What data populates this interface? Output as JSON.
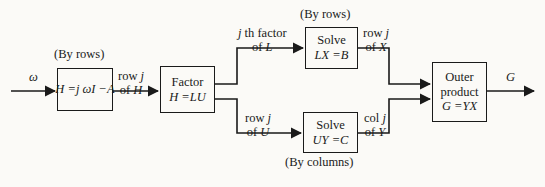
{
  "figure": {
    "type": "signal-flow-block-diagram",
    "input_symbol": "ω",
    "output_symbol": "G"
  },
  "blocks": [
    {
      "id": "form-matrix",
      "lines": [
        "H =j ωI −A"
      ],
      "caption": "(By rows)"
    },
    {
      "id": "factor",
      "lines": [
        "Factor",
        "H =LU"
      ],
      "caption": ""
    },
    {
      "id": "solve-lx",
      "lines": [
        "Solve",
        "LX =B"
      ],
      "caption": "(By rows)"
    },
    {
      "id": "solve-uy",
      "lines": [
        "Solve",
        "UY =C"
      ],
      "caption": "(By columns)"
    },
    {
      "id": "outer-product",
      "lines": [
        "Outer",
        "product",
        "G =YX"
      ],
      "caption": ""
    }
  ],
  "block_text": {
    "form_matrix_eq": "H =j ωI −A",
    "factor_word": "Factor",
    "factor_eq": "H =LU",
    "solve_word_upper": "Solve",
    "solve_eq_upper": "LX =B",
    "solve_word_lower": "Solve",
    "solve_eq_lower": "UY =C",
    "outer_word_1": "Outer",
    "outer_word_2": "product",
    "outer_eq": "G =YX"
  },
  "captions": {
    "by_rows_form": "(By rows)",
    "by_rows_solve": "(By rows)",
    "by_columns_solve": "(By columns)"
  },
  "edges": [
    {
      "id": "input",
      "top": "ω",
      "bottom": ""
    },
    {
      "id": "h-to-factor",
      "top": "row j",
      "bottom": "of H"
    },
    {
      "id": "factor-to-lx",
      "top": "j th factor",
      "bottom": "of L"
    },
    {
      "id": "factor-to-uy",
      "top": "row j",
      "bottom": "of U"
    },
    {
      "id": "lx-to-outer",
      "top": "row j",
      "bottom": "of X"
    },
    {
      "id": "uy-to-outer",
      "top": "col j",
      "bottom": "of Y"
    },
    {
      "id": "output",
      "top": "G",
      "bottom": ""
    }
  ],
  "edge_text": {
    "row_j_1": "row ",
    "row_j_1_var": "j",
    "of_h": "of ",
    "of_h_var": "H",
    "jth_factor_var": "j",
    "jth_factor_rest": " th factor",
    "of_l": "of ",
    "of_l_var": "L",
    "row_j_2": "row ",
    "row_j_2_var": "j",
    "of_u": "of ",
    "of_u_var": "U",
    "row_j_3": "row ",
    "row_j_3_var": "j",
    "of_x": "of ",
    "of_x_var": "X",
    "col_j": "col ",
    "col_j_var": "j",
    "of_y": "of ",
    "of_y_var": "Y"
  },
  "colors": {
    "ink": "#1a1a1a",
    "paper": "#fbfaf7"
  }
}
